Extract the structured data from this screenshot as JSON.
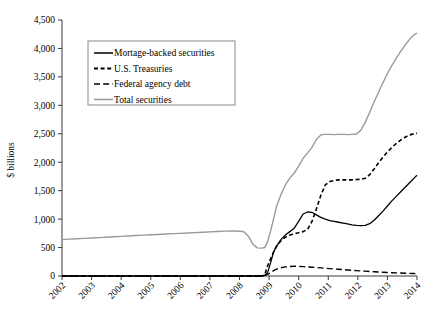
{
  "chart_data": {
    "type": "line",
    "title": "",
    "xlabel": "",
    "ylabel": "$ billions",
    "ylim": [
      0,
      4500
    ],
    "xlim": [
      2002,
      2014
    ],
    "grid": false,
    "legend_position": "top-left-inside",
    "ytick_labels": [
      "0",
      "500",
      "1,000",
      "1,500",
      "2,000",
      "2,500",
      "3,000",
      "3,500",
      "4,000",
      "4,500"
    ],
    "ytick_values": [
      0,
      500,
      1000,
      1500,
      2000,
      2500,
      3000,
      3500,
      4000,
      4500
    ],
    "xtick_labels": [
      "2002",
      "2003",
      "2004",
      "2005",
      "2006",
      "2007",
      "2008",
      "2009",
      "2010",
      "2011",
      "2012",
      "2013",
      "2014"
    ],
    "xtick_values": [
      2002,
      2003,
      2004,
      2005,
      2006,
      2007,
      2008,
      2009,
      2010,
      2011,
      2012,
      2013,
      2014
    ],
    "x": [
      2002.0,
      2002.25,
      2002.5,
      2002.75,
      2003.0,
      2003.25,
      2003.5,
      2003.75,
      2004.0,
      2004.25,
      2004.5,
      2004.75,
      2005.0,
      2005.25,
      2005.5,
      2005.75,
      2006.0,
      2006.25,
      2006.5,
      2006.75,
      2007.0,
      2007.25,
      2007.5,
      2007.75,
      2008.0,
      2008.15,
      2008.3,
      2008.45,
      2008.6,
      2008.75,
      2008.85,
      2008.95,
      2009.05,
      2009.15,
      2009.25,
      2009.4,
      2009.55,
      2009.7,
      2009.85,
      2010.0,
      2010.15,
      2010.3,
      2010.45,
      2010.6,
      2010.75,
      2010.9,
      2011.05,
      2011.2,
      2011.35,
      2011.5,
      2011.65,
      2011.8,
      2011.95,
      2012.1,
      2012.25,
      2012.4,
      2012.55,
      2012.7,
      2012.85,
      2013.0,
      2013.15,
      2013.3,
      2013.45,
      2013.6,
      2013.75,
      2013.9,
      2014.0
    ],
    "series": [
      {
        "name": "Mortage-backed securities",
        "style": "solid",
        "color": "#000000",
        "width": 1.3,
        "values": [
          0,
          0,
          0,
          0,
          0,
          0,
          0,
          0,
          0,
          0,
          0,
          0,
          0,
          0,
          0,
          0,
          0,
          0,
          0,
          0,
          0,
          0,
          0,
          0,
          0,
          0,
          0,
          0,
          0,
          0,
          10,
          60,
          230,
          420,
          520,
          640,
          720,
          780,
          840,
          960,
          1090,
          1125,
          1120,
          1075,
          1030,
          1000,
          975,
          960,
          945,
          930,
          915,
          900,
          890,
          885,
          890,
          920,
          980,
          1060,
          1140,
          1230,
          1320,
          1400,
          1480,
          1560,
          1640,
          1720,
          1770
        ]
      },
      {
        "name": "U.S. Treasuries",
        "style": "short-dash",
        "color": "#000000",
        "width": 1.6,
        "values": [
          0,
          0,
          0,
          0,
          0,
          0,
          0,
          0,
          0,
          0,
          0,
          0,
          0,
          0,
          0,
          0,
          0,
          0,
          0,
          0,
          0,
          0,
          0,
          0,
          0,
          0,
          0,
          0,
          0,
          0,
          20,
          180,
          300,
          420,
          520,
          620,
          680,
          720,
          740,
          760,
          780,
          820,
          960,
          1180,
          1420,
          1600,
          1660,
          1680,
          1690,
          1690,
          1690,
          1690,
          1695,
          1700,
          1720,
          1780,
          1880,
          1990,
          2090,
          2180,
          2260,
          2330,
          2390,
          2440,
          2480,
          2500,
          2510
        ]
      },
      {
        "name": "Federal agency debt",
        "style": "long-dash",
        "color": "#000000",
        "width": 1.4,
        "values": [
          0,
          0,
          0,
          0,
          0,
          0,
          0,
          0,
          0,
          0,
          0,
          0,
          0,
          0,
          0,
          0,
          0,
          0,
          0,
          0,
          0,
          0,
          0,
          0,
          0,
          0,
          0,
          0,
          0,
          0,
          10,
          30,
          60,
          95,
          120,
          145,
          160,
          168,
          172,
          170,
          165,
          160,
          155,
          148,
          142,
          137,
          130,
          124,
          118,
          112,
          106,
          100,
          95,
          90,
          85,
          80,
          75,
          70,
          66,
          62,
          58,
          55,
          52,
          49,
          46,
          43,
          40
        ]
      },
      {
        "name": "Total securities",
        "style": "solid",
        "color": "#9a9a9a",
        "width": 1.4,
        "values": [
          640,
          648,
          655,
          662,
          668,
          675,
          682,
          690,
          697,
          704,
          712,
          718,
          724,
          730,
          737,
          744,
          750,
          757,
          763,
          770,
          776,
          782,
          788,
          790,
          787,
          779,
          700,
          560,
          495,
          490,
          500,
          600,
          790,
          1000,
          1220,
          1430,
          1600,
          1720,
          1810,
          1930,
          2070,
          2160,
          2260,
          2400,
          2480,
          2490,
          2490,
          2485,
          2490,
          2490,
          2485,
          2490,
          2495,
          2560,
          2700,
          2880,
          3060,
          3230,
          3400,
          3560,
          3700,
          3830,
          3950,
          4060,
          4160,
          4240,
          4270
        ]
      }
    ]
  },
  "legend": {
    "entries": [
      {
        "label": "Mortage-backed securities"
      },
      {
        "label": "U.S. Treasuries"
      },
      {
        "label": "Federal agency debt"
      },
      {
        "label": "Total securities"
      }
    ]
  }
}
